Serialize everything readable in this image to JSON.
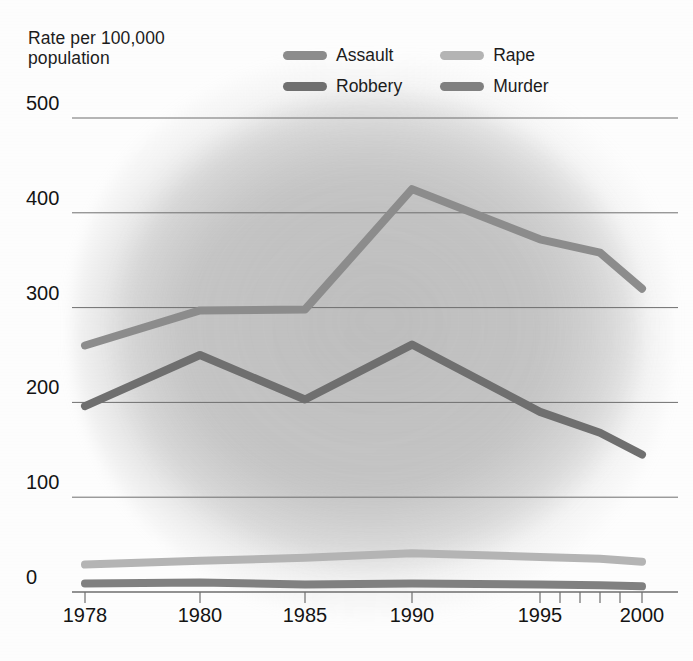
{
  "axis_title": "Rate per 100,000\npopulation",
  "legend": {
    "items": [
      {
        "label": "Assault",
        "color": "#8c8c8c",
        "key": "assault"
      },
      {
        "label": "Rape",
        "color": "#b4b4b4",
        "key": "rape"
      },
      {
        "label": "Robbery",
        "color": "#6f6f6f",
        "key": "robbery"
      },
      {
        "label": "Murder",
        "color": "#808080",
        "key": "murder"
      }
    ]
  },
  "chart_data": {
    "type": "line",
    "title": "",
    "subtitle": "",
    "xlabel": "",
    "ylabel": "Rate per 100,000 population",
    "x": [
      1978,
      1980,
      1985,
      1990,
      1995,
      1998,
      2000
    ],
    "x_tick_labels": [
      "1978",
      "1980",
      "1985",
      "1990",
      "1995",
      "2000"
    ],
    "x_ticks": [
      1978,
      1980,
      1985,
      1990,
      1995,
      2000
    ],
    "y_tick_labels": [
      "0",
      "100",
      "200",
      "300",
      "400",
      "500"
    ],
    "y_ticks": [
      0,
      100,
      200,
      300,
      400,
      500
    ],
    "xlim": [
      1978,
      2000
    ],
    "ylim": [
      0,
      500
    ],
    "grid": true,
    "grid_axis": "y",
    "legend_position": "top-center",
    "series": [
      {
        "name": "Assault",
        "color": "#8c8c8c",
        "values": [
          260,
          297,
          298,
          425,
          372,
          358,
          320
        ]
      },
      {
        "name": "Robbery",
        "color": "#6f6f6f",
        "values": [
          196,
          250,
          203,
          261,
          190,
          168,
          145
        ]
      },
      {
        "name": "Rape",
        "color": "#b4b4b4",
        "values": [
          29,
          33,
          36,
          41,
          37,
          35,
          32
        ]
      },
      {
        "name": "Murder",
        "color": "#808080",
        "values": [
          9,
          10,
          8,
          9,
          8,
          7,
          6
        ]
      }
    ]
  }
}
